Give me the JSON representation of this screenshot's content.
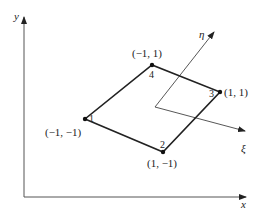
{
  "figure": {
    "global_axes": {
      "x_label": "x",
      "y_label": "y"
    },
    "local_axes": {
      "xi_label": "ξ",
      "eta_label": "η"
    },
    "element": {
      "shape": "quadrilateral",
      "nodes": [
        {
          "number": "1",
          "natural_coords": "(−1, −1)"
        },
        {
          "number": "2",
          "natural_coords": "(1, −1)"
        },
        {
          "number": "3",
          "natural_coords": "(1, 1)"
        },
        {
          "number": "4",
          "natural_coords": "(−1, 1)"
        }
      ]
    },
    "colors": {
      "line": "#222222",
      "axis": "#555555",
      "background": "#ffffff"
    }
  }
}
